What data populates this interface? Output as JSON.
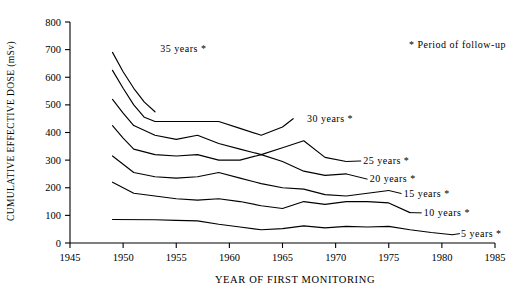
{
  "chart_data": {
    "type": "line",
    "title": "",
    "xlabel": "YEAR OF FIRST MONITORING",
    "ylabel": "CUMULATIVE EFFECTIVE DOSE (mSv)",
    "xlim": [
      1945,
      1985
    ],
    "ylim": [
      0,
      800
    ],
    "xticks": [
      1945,
      1950,
      1955,
      1960,
      1965,
      1970,
      1975,
      1980,
      1985
    ],
    "yticks": [
      0,
      100,
      200,
      300,
      400,
      500,
      600,
      700,
      800
    ],
    "grid": false,
    "legend_position": "top-right",
    "legend_note": "*  Period of follow-up",
    "legend_marker": "*",
    "series": [
      {
        "name": "35 years",
        "label": "35  years  *",
        "x": [
          1949,
          1950,
          1951,
          1952,
          1953
        ],
        "values": [
          690,
          620,
          560,
          510,
          475
        ]
      },
      {
        "name": "30 years",
        "label": "30  years  *",
        "x": [
          1949,
          1950,
          1951,
          1952,
          1953,
          1955,
          1957,
          1959,
          1961,
          1963,
          1965,
          1966
        ],
        "values": [
          625,
          560,
          500,
          455,
          440,
          440,
          440,
          440,
          415,
          390,
          420,
          450
        ]
      },
      {
        "name": "25 years",
        "label": "25  years  *",
        "x": [
          1949,
          1950,
          1951,
          1953,
          1955,
          1957,
          1959,
          1961,
          1963,
          1965,
          1967,
          1969,
          1971
        ],
        "values": [
          520,
          470,
          425,
          390,
          375,
          390,
          360,
          340,
          320,
          345,
          370,
          310,
          295
        ]
      },
      {
        "name": "20 years",
        "label": "20  years  *",
        "x": [
          1949,
          1950,
          1951,
          1953,
          1955,
          1957,
          1959,
          1961,
          1963,
          1965,
          1967,
          1969,
          1971
        ],
        "values": [
          425,
          380,
          340,
          320,
          315,
          320,
          300,
          300,
          320,
          295,
          260,
          245,
          250
        ]
      },
      {
        "name": "15 years",
        "label": "15  years  *",
        "x": [
          1949,
          1951,
          1953,
          1955,
          1957,
          1959,
          1961,
          1963,
          1965,
          1967,
          1969,
          1971,
          1973,
          1975
        ],
        "values": [
          315,
          255,
          240,
          235,
          240,
          255,
          235,
          215,
          200,
          195,
          175,
          170,
          180,
          190
        ]
      },
      {
        "name": "10 years",
        "label": "10  years  *",
        "x": [
          1949,
          1951,
          1953,
          1955,
          1957,
          1959,
          1961,
          1963,
          1965,
          1967,
          1969,
          1971,
          1973,
          1975,
          1977
        ],
        "values": [
          220,
          180,
          170,
          160,
          155,
          160,
          150,
          135,
          125,
          150,
          140,
          150,
          150,
          145,
          110
        ]
      },
      {
        "name": "5 years",
        "label": "5  years  *",
        "x": [
          1949,
          1953,
          1955,
          1957,
          1959,
          1961,
          1963,
          1965,
          1967,
          1969,
          1971,
          1973,
          1975,
          1977,
          1979,
          1981
        ],
        "values": [
          85,
          84,
          82,
          80,
          68,
          58,
          48,
          52,
          62,
          55,
          60,
          58,
          60,
          48,
          38,
          30
        ]
      }
    ],
    "series_label_positions": [
      {
        "name": "35 years",
        "x": 1953.5,
        "y": 705,
        "leader": false
      },
      {
        "name": "30 years",
        "x": 1967.3,
        "y": 452,
        "leader": false
      },
      {
        "name": "25 years",
        "x": 1972.6,
        "y": 300,
        "leader": true,
        "lx1": 1971,
        "ly1": 295,
        "lx2": 1972.4,
        "ly2": 297
      },
      {
        "name": "20 years",
        "x": 1973.2,
        "y": 232,
        "leader": true,
        "lx1": 1971,
        "ly1": 250,
        "lx2": 1973,
        "ly2": 231
      },
      {
        "name": "15 years",
        "x": 1976.4,
        "y": 180,
        "leader": true,
        "lx1": 1975,
        "ly1": 190,
        "lx2": 1976.2,
        "ly2": 179
      },
      {
        "name": "10 years",
        "x": 1978.3,
        "y": 110,
        "leader": true,
        "lx1": 1977,
        "ly1": 110,
        "lx2": 1978.1,
        "ly2": 109
      },
      {
        "name": "5 years",
        "x": 1981.8,
        "y": 35,
        "leader": true,
        "lx1": 1981,
        "ly1": 30,
        "lx2": 1981.7,
        "ly2": 34
      }
    ]
  }
}
